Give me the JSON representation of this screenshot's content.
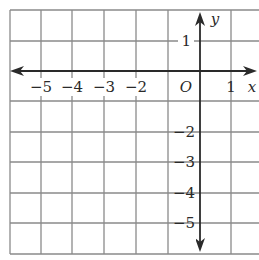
{
  "diagram": {
    "type": "coordinate-grid",
    "x_axis": {
      "label": "x",
      "range": [
        -6,
        2
      ],
      "tick_labels": [
        {
          "value": -5,
          "text": "−5"
        },
        {
          "value": -4,
          "text": "−4"
        },
        {
          "value": -3,
          "text": "−3"
        },
        {
          "value": -2,
          "text": "−2"
        },
        {
          "value": 1,
          "text": "1"
        }
      ]
    },
    "y_axis": {
      "label": "y",
      "range": [
        -6,
        2
      ],
      "tick_labels": [
        {
          "value": 1,
          "text": "1"
        },
        {
          "value": -2,
          "text": "−2"
        },
        {
          "value": -3,
          "text": "−3"
        },
        {
          "value": -4,
          "text": "−4"
        },
        {
          "value": -5,
          "text": "−5"
        }
      ]
    },
    "origin_label": "O",
    "colors": {
      "grid": "#8a8a8a",
      "axis": "#2a2a2a",
      "background": "#ffffff"
    }
  }
}
